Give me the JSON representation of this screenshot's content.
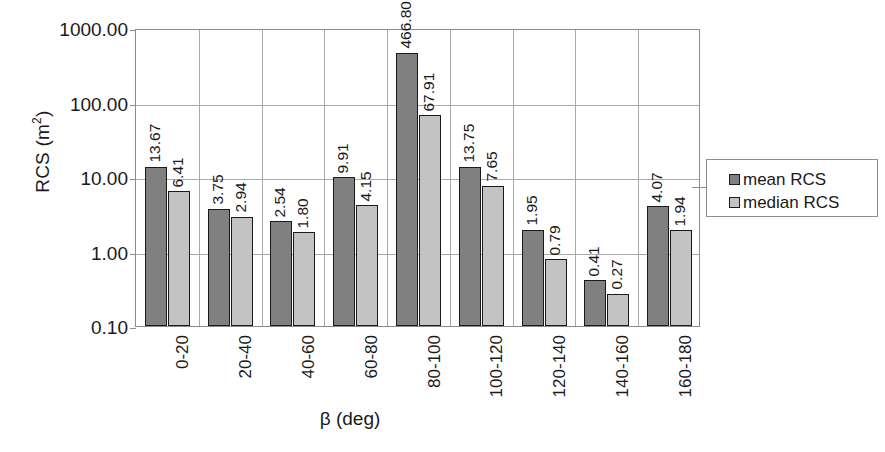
{
  "chart_data": {
    "type": "bar",
    "title": "",
    "xlabel": "β (deg)",
    "ylabel": "RCS (m²)",
    "ylabel_base": "RCS (m",
    "ylabel_sup": "2",
    "ylabel_tail": ")",
    "yscale": "log",
    "ylim": [
      0.1,
      1000
    ],
    "grid": true,
    "legend_position": "right",
    "categories": [
      "0-20",
      "20-40",
      "40-60",
      "60-80",
      "80-100",
      "100-120",
      "120-140",
      "140-160",
      "160-180"
    ],
    "ytick_labels": [
      "1000.00",
      "100.00",
      "10.00",
      "1.00",
      "0.10"
    ],
    "ytick_values": [
      1000,
      100,
      10,
      1,
      0.1
    ],
    "series": [
      {
        "name": "mean RCS",
        "color": "#808080",
        "values": [
          13.67,
          3.75,
          2.54,
          9.91,
          466.8,
          13.75,
          1.95,
          0.41,
          4.07
        ],
        "labels": [
          "13.67",
          "3.75",
          "2.54",
          "9.91",
          "466.80",
          "13.75",
          "1.95",
          "0.41",
          "4.07"
        ]
      },
      {
        "name": "median RCS",
        "color": "#c3c3c3",
        "values": [
          6.41,
          2.94,
          1.8,
          4.15,
          67.91,
          7.65,
          0.79,
          0.27,
          1.94
        ],
        "labels": [
          "6.41",
          "2.94",
          "1.80",
          "4.15",
          "67.91",
          "7.65",
          "0.79",
          "0.27",
          "1.94"
        ]
      }
    ]
  },
  "legend": {
    "items": [
      {
        "label": "mean RCS",
        "swatch": "mean"
      },
      {
        "label": "median RCS",
        "swatch": "median"
      }
    ]
  }
}
